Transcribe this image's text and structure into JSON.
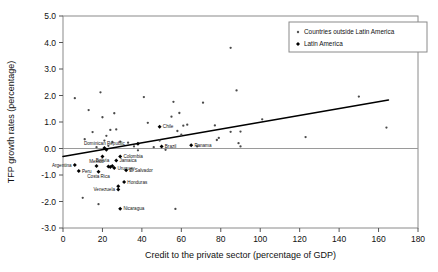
{
  "chart_data": {
    "type": "scatter",
    "title": "",
    "xlabel": "Credit to the private sector (percentage of GDP)",
    "ylabel": "TFP growth rates (percentage)",
    "xlim": [
      0,
      180
    ],
    "ylim": [
      -3.0,
      5.0
    ],
    "xticks": [
      "0",
      "20",
      "40",
      "60",
      "80",
      "100",
      "120",
      "140",
      "160",
      "180"
    ],
    "yticks": [
      "5.0",
      "4.0",
      "3.0",
      "2.0",
      "1.0",
      "0.0",
      "-1.0",
      "-2.0",
      "-3.0"
    ],
    "grid": false,
    "zero_line": true,
    "legend_position": "top-right",
    "legend": [
      {
        "name": "Countries outside Latin America",
        "marker": "small-dot",
        "color": "#555555"
      },
      {
        "name": "Latin America",
        "marker": "filled-diamond",
        "color": "#000000"
      }
    ],
    "trendline": {
      "x0": 0,
      "y0": -0.3,
      "x1": 165,
      "y1": 1.83,
      "color": "#000000"
    },
    "series": [
      {
        "name": "Countries outside Latin America",
        "points": [
          {
            "x": 6,
            "y": 1.9
          },
          {
            "x": 10,
            "y": -1.86
          },
          {
            "x": 11,
            "y": 0.35
          },
          {
            "x": 13,
            "y": 1.45
          },
          {
            "x": 15,
            "y": 0.62
          },
          {
            "x": 17,
            "y": 0.05
          },
          {
            "x": 18,
            "y": -2.1
          },
          {
            "x": 19,
            "y": 2.12
          },
          {
            "x": 20,
            "y": 1.18
          },
          {
            "x": 21,
            "y": 0.3
          },
          {
            "x": 22,
            "y": 0.48
          },
          {
            "x": 23,
            "y": 0.1
          },
          {
            "x": 24,
            "y": 0.7
          },
          {
            "x": 25,
            "y": 0.25
          },
          {
            "x": 26,
            "y": 1.33
          },
          {
            "x": 27,
            "y": 0.72
          },
          {
            "x": 29,
            "y": 0.26
          },
          {
            "x": 33,
            "y": 0.22
          },
          {
            "x": 36,
            "y": 0.08
          },
          {
            "x": 38,
            "y": -0.07
          },
          {
            "x": 41,
            "y": 1.94
          },
          {
            "x": 43,
            "y": 0.97
          },
          {
            "x": 46,
            "y": 0.05
          },
          {
            "x": 49,
            "y": 0.3
          },
          {
            "x": 52,
            "y": -0.05
          },
          {
            "x": 55,
            "y": 1.2
          },
          {
            "x": 56,
            "y": 1.76
          },
          {
            "x": 57,
            "y": -2.28
          },
          {
            "x": 58,
            "y": 0.66
          },
          {
            "x": 59,
            "y": 1.34
          },
          {
            "x": 60,
            "y": 0.52
          },
          {
            "x": 61,
            "y": 0.86
          },
          {
            "x": 63,
            "y": 0.9
          },
          {
            "x": 68,
            "y": 0.08
          },
          {
            "x": 71,
            "y": 1.73
          },
          {
            "x": 77,
            "y": 0.87
          },
          {
            "x": 78,
            "y": 0.32
          },
          {
            "x": 79,
            "y": 0.4
          },
          {
            "x": 85,
            "y": 3.8
          },
          {
            "x": 85,
            "y": 0.63
          },
          {
            "x": 88,
            "y": 2.19
          },
          {
            "x": 89,
            "y": 0.2
          },
          {
            "x": 90,
            "y": 0.08
          },
          {
            "x": 90,
            "y": 0.64
          },
          {
            "x": 101,
            "y": 1.1
          },
          {
            "x": 123,
            "y": 0.43
          },
          {
            "x": 150,
            "y": 1.96
          },
          {
            "x": 164,
            "y": 0.79
          }
        ]
      },
      {
        "name": "Latin America",
        "points": [
          {
            "x": 6,
            "y": -0.62,
            "label": "Argentina",
            "label_pos": "left"
          },
          {
            "x": 8,
            "y": -0.85,
            "label": "Peru",
            "label_pos": "right"
          },
          {
            "x": 17,
            "y": -0.66,
            "label": "Mexico",
            "label_pos": "above"
          },
          {
            "x": 18,
            "y": -0.88,
            "label": "Costa Rica",
            "label_pos": "below"
          },
          {
            "x": 20,
            "y": -0.3,
            "label": "Bolivia",
            "label_pos": "below"
          },
          {
            "x": 21,
            "y": 0.02,
            "label": "Dominican Republic",
            "label_pos": "above"
          },
          {
            "x": 22,
            "y": -0.05,
            "label": "",
            "label_pos": "none"
          },
          {
            "x": 23,
            "y": -0.68,
            "label": "",
            "label_pos": "none"
          },
          {
            "x": 24,
            "y": -0.7,
            "label": "",
            "label_pos": "none"
          },
          {
            "x": 25,
            "y": -0.66,
            "label": "",
            "label_pos": "none"
          },
          {
            "x": 26,
            "y": -0.74,
            "label": "Uruguay",
            "label_pos": "right"
          },
          {
            "x": 27,
            "y": -0.45,
            "label": "Jamaica",
            "label_pos": "right"
          },
          {
            "x": 28,
            "y": -1.55,
            "label": "Venezuela",
            "label_pos": "left"
          },
          {
            "x": 28,
            "y": -1.42,
            "label": "",
            "label_pos": "none"
          },
          {
            "x": 29,
            "y": -0.3,
            "label": "Colombia",
            "label_pos": "right"
          },
          {
            "x": 29,
            "y": -2.27,
            "label": "Nicaragua",
            "label_pos": "right"
          },
          {
            "x": 31,
            "y": -1.26,
            "label": "Honduras",
            "label_pos": "right"
          },
          {
            "x": 32,
            "y": -0.82,
            "label": "El Salvador",
            "label_pos": "right"
          },
          {
            "x": 38,
            "y": 0.18,
            "label": "",
            "label_pos": "none"
          },
          {
            "x": 49,
            "y": 0.82,
            "label": "Chile",
            "label_pos": "right"
          },
          {
            "x": 50,
            "y": 0.08,
            "label": "Brazil",
            "label_pos": "right"
          },
          {
            "x": 65,
            "y": 0.12,
            "label": "Panama",
            "label_pos": "right"
          }
        ]
      }
    ]
  }
}
